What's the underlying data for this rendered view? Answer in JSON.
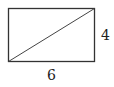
{
  "diagram": {
    "shape": "rectangle-with-diagonal",
    "rect": {
      "x": 8,
      "y": 8,
      "width": 87,
      "height": 54
    },
    "diagonal": {
      "from": "bottom-left",
      "to": "top-right"
    },
    "labels": {
      "height": "4",
      "width": "6"
    },
    "stroke_color": "#333333"
  }
}
